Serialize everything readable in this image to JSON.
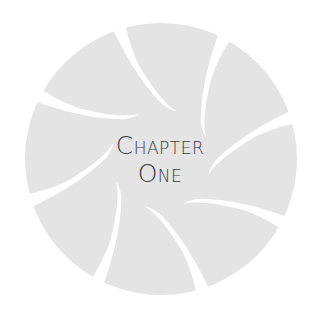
{
  "emblem": {
    "shape": "aperture-swirl",
    "fill_color": "#e4e4e4",
    "gap_color": "#ffffff",
    "gap_count": 8
  },
  "heading": {
    "line1": {
      "cap": "C",
      "rest": "HAPTER"
    },
    "line2": {
      "cap": "O",
      "rest": "NE"
    },
    "text_color": "#3a3a3a"
  }
}
